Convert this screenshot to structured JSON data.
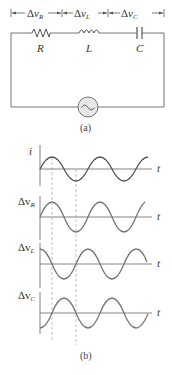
{
  "figure": {
    "part_a": {
      "caption": "(a)",
      "voltage_labels": {
        "resistor": {
          "delta": "Δ",
          "v": "v",
          "sub": "R"
        },
        "inductor": {
          "delta": "Δ",
          "v": "v",
          "sub": "L"
        },
        "capacitor": {
          "delta": "Δ",
          "v": "v",
          "sub": "C"
        }
      },
      "component_labels": {
        "resistor": "R",
        "inductor": "L",
        "capacitor": "C"
      },
      "source_symbol": "~"
    },
    "part_b": {
      "caption": "(b)",
      "time_label": "t",
      "graphs": [
        {
          "name": "current",
          "label_main": "i",
          "label_sub": "",
          "phase": "in phase (reference)"
        },
        {
          "name": "resistor-voltage",
          "label_main": "Δv",
          "label_sub": "R",
          "phase": "in phase with i"
        },
        {
          "name": "inductor-voltage",
          "label_main": "Δv",
          "label_sub": "L",
          "phase": "leads i by 90°"
        },
        {
          "name": "capacitor-voltage",
          "label_main": "Δv",
          "label_sub": "C",
          "phase": "lags i by 90°"
        }
      ]
    },
    "colors": {
      "line": "#666666",
      "wave": "#777777",
      "current_wave": "#555555",
      "source_fill": "#e8e8e8",
      "dashed": "#aaaaaa"
    }
  }
}
